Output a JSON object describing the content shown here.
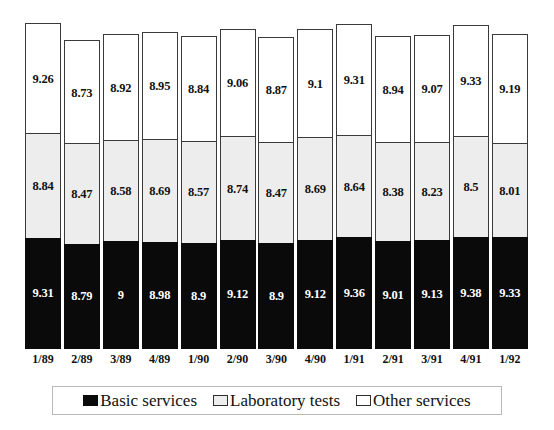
{
  "chart_data": {
    "type": "bar",
    "stacked": true,
    "title": "",
    "subtitle": "",
    "xlabel": "",
    "ylabel": "",
    "grid": false,
    "legend_position": "bottom",
    "ylim": [
      0,
      30
    ],
    "categories": [
      "1/89",
      "2/89",
      "3/89",
      "4/89",
      "1/90",
      "2/90",
      "3/90",
      "4/90",
      "1/91",
      "2/91",
      "3/91",
      "4/91",
      "1/92"
    ],
    "series": [
      {
        "name": "Basic services",
        "color": "#0a0a0a",
        "values": [
          9.31,
          8.79,
          9,
          8.98,
          8.9,
          9.12,
          8.9,
          9.12,
          9.36,
          9.01,
          9.13,
          9.38,
          9.33
        ],
        "labels": [
          "9.31",
          "8.79",
          "9",
          "8.98",
          "8.9",
          "9.12",
          "8.9",
          "9.12",
          "9.36",
          "9.01",
          "9.13",
          "9.38",
          "9.33"
        ]
      },
      {
        "name": "Laboratory tests",
        "color": "#ededed",
        "values": [
          8.84,
          8.47,
          8.58,
          8.69,
          8.57,
          8.74,
          8.47,
          8.69,
          8.64,
          8.38,
          8.23,
          8.5,
          8.01
        ],
        "labels": [
          "8.84",
          "8.47",
          "8.58",
          "8.69",
          "8.57",
          "8.74",
          "8.47",
          "8.69",
          "8.64",
          "8.38",
          "8.23",
          "8.5",
          "8.01"
        ]
      },
      {
        "name": "Other services",
        "color": "#ffffff",
        "values": [
          9.26,
          8.73,
          8.92,
          8.95,
          8.84,
          9.06,
          8.87,
          9.1,
          9.31,
          8.94,
          9.07,
          9.33,
          9.19
        ],
        "labels": [
          "9.26",
          "8.73",
          "8.92",
          "8.95",
          "8.84",
          "9.06",
          "8.87",
          "9.1",
          "9.31",
          "8.94",
          "9.07",
          "9.33",
          "9.19"
        ]
      }
    ]
  },
  "legend": {
    "items": [
      {
        "label": "Basic services",
        "swatch": "black-swatch-icon"
      },
      {
        "label": "Laboratory tests",
        "swatch": "gray-swatch-icon"
      },
      {
        "label": "Other services",
        "swatch": "white-swatch-icon"
      }
    ]
  }
}
